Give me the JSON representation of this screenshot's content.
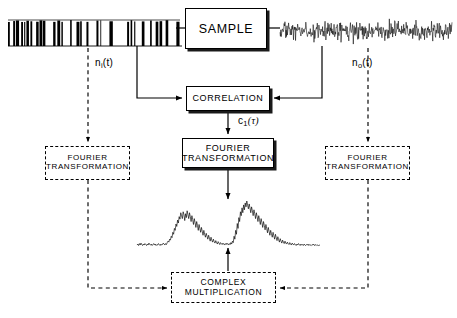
{
  "diagram": {
    "background_color": "#ffffff",
    "line_color": "#000000"
  },
  "boxes": {
    "sample": {
      "label": "SAMPLE",
      "style": "solid"
    },
    "correlation": {
      "label": "CORRELATION",
      "style": "solid"
    },
    "fourier_center": {
      "line1": "FOURIER",
      "line2": "TRANSFORMATION",
      "style": "solid"
    },
    "fourier_left": {
      "line1": "FOURIER",
      "line2": "TRANSFORMATION",
      "style": "dashed"
    },
    "fourier_right": {
      "line1": "FOURIER",
      "line2": "TRANSFORMATION",
      "style": "dashed"
    },
    "complex_multiply": {
      "line1": "COMPLEX",
      "line2": "MULTIPLICATION",
      "style": "dashed"
    }
  },
  "signal_labels": {
    "input_noise": {
      "base": "n",
      "sub": "i",
      "arg": "(t)"
    },
    "output_noise": {
      "base": "n",
      "sub": "o",
      "arg": "(t)"
    },
    "correlation_out": {
      "base": "c",
      "sub": "1",
      "arg": "(τ)"
    }
  },
  "waveforms": {
    "input_signal": {
      "name": "binary-pseudo-random-sequence",
      "description": "dense black vertical bar / square-wave pseudo-random bit stream"
    },
    "output_signal": {
      "name": "noisy-analog-waveform",
      "description": "continuous random noise trace"
    },
    "spectrum": {
      "name": "power-spectrum-trace",
      "description": "noisy baseline with two broad peak clusters"
    }
  },
  "chart_data": {
    "type": "line",
    "title": "",
    "xlabel": "",
    "ylabel": "",
    "series": [
      {
        "name": "spectrum",
        "values": [
          4,
          6,
          3,
          7,
          4,
          8,
          5,
          3,
          6,
          4,
          7,
          5,
          3,
          6,
          4,
          8,
          5,
          4,
          6,
          3,
          5,
          7,
          4,
          6,
          3,
          5,
          4,
          7,
          5,
          3,
          6,
          4,
          5,
          8,
          6,
          4,
          7,
          5,
          9,
          12,
          10,
          16,
          14,
          22,
          19,
          30,
          26,
          38,
          34,
          47,
          42,
          55,
          49,
          62,
          57,
          70,
          64,
          58,
          72,
          66,
          54,
          68,
          60,
          74,
          66,
          58,
          70,
          62,
          52,
          64,
          56,
          46,
          58,
          50,
          40,
          52,
          44,
          34,
          46,
          38,
          30,
          40,
          32,
          24,
          34,
          26,
          20,
          28,
          22,
          16,
          24,
          18,
          12,
          20,
          14,
          10,
          16,
          11,
          8,
          13,
          9,
          6,
          11,
          8,
          5,
          9,
          7,
          5,
          8,
          6,
          4,
          7,
          5,
          8,
          6,
          4,
          7,
          5,
          9,
          6,
          12,
          9,
          22,
          16,
          34,
          26,
          48,
          38,
          60,
          52,
          72,
          64,
          80,
          70,
          86,
          76,
          90,
          82,
          94,
          86,
          78,
          88,
          80,
          70,
          82,
          74,
          64,
          76,
          68,
          58,
          70,
          62,
          52,
          64,
          56,
          46,
          58,
          50,
          40,
          52,
          44,
          35,
          46,
          38,
          29,
          40,
          32,
          24,
          34,
          27,
          20,
          30,
          23,
          16,
          26,
          19,
          13,
          21,
          15,
          10,
          17,
          12,
          8,
          14,
          10,
          7,
          12,
          8,
          6,
          10,
          7,
          5,
          9,
          6,
          4,
          8,
          6,
          4,
          7,
          5,
          3,
          6,
          4,
          7,
          5,
          3,
          6,
          4,
          5,
          3,
          6,
          4,
          3,
          5,
          4,
          6,
          3,
          5,
          4,
          3,
          5,
          4,
          6,
          3,
          4,
          5,
          3,
          4,
          3,
          4,
          3
        ]
      }
    ],
    "peaks": [
      {
        "label": "left-peak-cluster",
        "approx_center_fraction": 0.27,
        "approx_height": 72
      },
      {
        "label": "right-peak-cluster",
        "approx_center_fraction": 0.47,
        "approx_height": 94
      }
    ],
    "grid": false,
    "legend": false
  },
  "connections": [
    {
      "name": "sample-input",
      "from": "input_signal",
      "to": "sample",
      "style": "solid",
      "arrow": true
    },
    {
      "name": "sample-output",
      "from": "sample",
      "to": "output_signal",
      "style": "solid",
      "arrow": true
    },
    {
      "name": "input-to-correlation",
      "from": "input_signal",
      "to": "correlation",
      "style": "solid",
      "arrow": true
    },
    {
      "name": "output-to-correlation",
      "from": "output_signal",
      "to": "correlation",
      "style": "solid",
      "arrow": true
    },
    {
      "name": "correlation-to-fourier",
      "from": "correlation",
      "to": "fourier_center",
      "style": "solid",
      "arrow": true
    },
    {
      "name": "fourier-to-spectrum",
      "from": "fourier_center",
      "to": "spectrum",
      "style": "solid",
      "arrow": true
    },
    {
      "name": "input-to-fourier-left",
      "from": "input_signal",
      "to": "fourier_left",
      "style": "dashed",
      "arrow": true
    },
    {
      "name": "output-to-fourier-right",
      "from": "output_signal",
      "to": "fourier_right",
      "style": "dashed",
      "arrow": true
    },
    {
      "name": "fourier-left-to-complex",
      "from": "fourier_left",
      "to": "complex_multiply",
      "style": "dashed",
      "arrow": true
    },
    {
      "name": "fourier-right-to-complex",
      "from": "fourier_right",
      "to": "complex_multiply",
      "style": "dashed",
      "arrow": true
    },
    {
      "name": "complex-to-spectrum",
      "from": "complex_multiply",
      "to": "spectrum",
      "style": "solid",
      "arrow": true
    }
  ]
}
